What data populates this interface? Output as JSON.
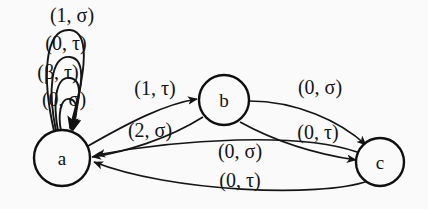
{
  "diagram": {
    "type": "state-transition-diagram",
    "background_color": "#fafafa",
    "stroke_color": "#151515",
    "states": [
      {
        "id": "a",
        "label": "a",
        "cx": 62,
        "cy": 158,
        "r": 28
      },
      {
        "id": "b",
        "label": "b",
        "cx": 224,
        "cy": 100,
        "r": 25
      },
      {
        "id": "c",
        "label": "c",
        "cx": 380,
        "cy": 162,
        "r": 24
      }
    ],
    "self_loops": [
      {
        "state": "a",
        "label": "(1, σ)",
        "label_x": 72,
        "label_y": 22
      },
      {
        "state": "a",
        "label": "(0, τ)",
        "label_x": 66,
        "label_y": 50
      },
      {
        "state": "a",
        "label": "(β, τ)",
        "label_x": 58,
        "label_y": 79
      },
      {
        "state": "a",
        "label": "(0, σ)",
        "label_x": 64,
        "label_y": 106
      }
    ],
    "transitions": [
      {
        "from": "a",
        "to": "b",
        "label": "(1, τ)",
        "label_x": 155,
        "label_y": 95
      },
      {
        "from": "b",
        "to": "a",
        "label": "(2, σ)",
        "label_x": 150,
        "label_y": 137
      },
      {
        "from": "b",
        "to": "c",
        "label": "(0, σ)",
        "label_x": 320,
        "label_y": 94
      },
      {
        "from": "b",
        "to": "c",
        "label": "(0, τ)",
        "label_x": 318,
        "label_y": 139
      },
      {
        "from": "c",
        "to": "a",
        "label": "(0, σ)",
        "label_x": 240,
        "label_y": 158
      },
      {
        "from": "c",
        "to": "a",
        "label": "(0, τ)",
        "label_x": 240,
        "label_y": 187
      }
    ]
  }
}
